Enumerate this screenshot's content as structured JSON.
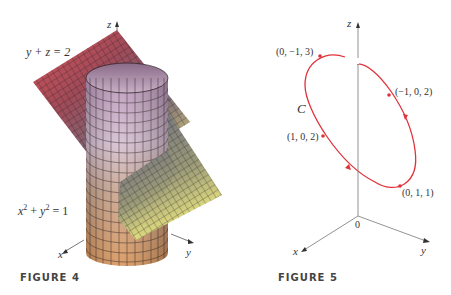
{
  "figure4": {
    "caption": "FIGURE 4",
    "plane_label": "y + z = 2",
    "cylinder_label": {
      "x": "x",
      "x_exp": "2",
      "plus": " + ",
      "y": "y",
      "y_exp": "2",
      "rhs": " = 1"
    },
    "axes": {
      "x": "x",
      "y": "y",
      "z": "z"
    },
    "colors": {
      "plane_top": "#9a4a55",
      "plane_left": "#d9555a",
      "plane_right": "#6a6a80",
      "plane_bottom": "#e8e27a",
      "cylinder_top": "#c8a6c4",
      "cylinder_bottom": "#d99a5a",
      "grid": "#2a1f22"
    }
  },
  "figure5": {
    "caption": "FIGURE 5",
    "curve_label": "C",
    "axes": {
      "x": "x",
      "y": "y",
      "z": "z",
      "origin": "0"
    },
    "points": [
      {
        "label": "(0, −1, 3)"
      },
      {
        "label": "(−1, 0, 2)"
      },
      {
        "label": "(1, 0, 2)"
      },
      {
        "label": "(0, 1, 1)"
      }
    ],
    "colors": {
      "curve": "#e0323a",
      "axis": "#666666"
    }
  }
}
